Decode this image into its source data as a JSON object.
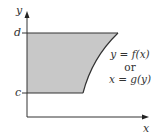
{
  "diagram": {
    "axes": {
      "x_label": "x",
      "y_label": "y"
    },
    "levels": {
      "upper": "d",
      "lower": "c"
    },
    "curve_label": {
      "line1": "y = f(x)",
      "line2": "or",
      "line3": "x = g(y)"
    },
    "colors": {
      "region_fill": "#c8c8c8",
      "stroke": "#333333"
    }
  }
}
